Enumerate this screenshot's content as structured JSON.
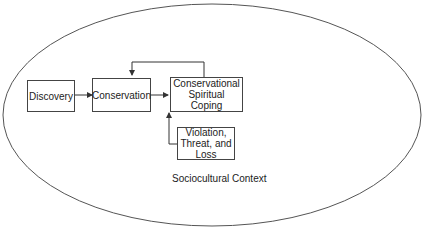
{
  "diagram": {
    "nodes": [
      {
        "id": "discovery",
        "label": "Discovery"
      },
      {
        "id": "conservation",
        "label": "Conservation"
      },
      {
        "id": "coping",
        "label": "Conservational\nSpiritual\nCoping"
      },
      {
        "id": "violation",
        "label": "Violation,\nThreat, and\nLoss"
      }
    ],
    "edges": [
      {
        "from": "discovery",
        "to": "conservation"
      },
      {
        "from": "conservation",
        "to": "coping"
      },
      {
        "from": "coping",
        "to": "conservation",
        "type": "feedback"
      },
      {
        "from": "violation",
        "to": "coping"
      }
    ],
    "context_label": "Sociocultural Context"
  }
}
